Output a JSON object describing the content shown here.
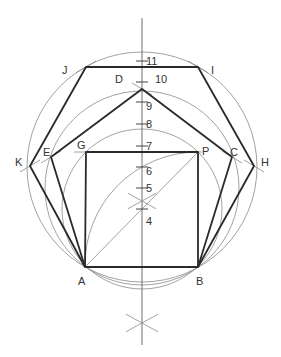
{
  "diagram": {
    "title": "",
    "axis": {
      "x": 142,
      "y1": 18,
      "y2": 345
    },
    "ticks": [
      {
        "label": "4",
        "y": 209,
        "lx": 146,
        "ly": 225
      },
      {
        "label": "5",
        "y": 188,
        "lx": 146,
        "ly": 192
      },
      {
        "label": "6",
        "y": 167,
        "lx": 146,
        "ly": 175
      },
      {
        "label": "7",
        "y": 146,
        "lx": 146,
        "ly": 150
      },
      {
        "label": "8",
        "y": 124,
        "lx": 146,
        "ly": 128
      },
      {
        "label": "9",
        "y": 102,
        "lx": 146,
        "ly": 110
      },
      {
        "label": "10",
        "y": 82,
        "lx": 155,
        "ly": 83
      },
      {
        "label": "11",
        "y": 61,
        "lx": 146,
        "ly": 65
      }
    ],
    "points": {
      "A": {
        "x": 85,
        "y": 267,
        "lx": 78,
        "ly": 285
      },
      "B": {
        "x": 198,
        "y": 267,
        "lx": 196,
        "ly": 285
      },
      "G": {
        "x": 86,
        "y": 152,
        "lx": 77,
        "ly": 149
      },
      "P": {
        "x": 198,
        "y": 152,
        "lx": 202,
        "ly": 155
      },
      "D": {
        "x": 142,
        "y": 89,
        "lx": 115,
        "ly": 83
      },
      "E": {
        "x": 51,
        "y": 157,
        "lx": 43,
        "ly": 156
      },
      "C": {
        "x": 232,
        "y": 157,
        "lx": 230,
        "ly": 156
      },
      "J": {
        "x": 86,
        "y": 67,
        "lx": 62,
        "ly": 74
      },
      "I": {
        "x": 198,
        "y": 67,
        "lx": 211,
        "ly": 74
      },
      "K": {
        "x": 30,
        "y": 166,
        "lx": 15,
        "ly": 166
      },
      "H": {
        "x": 254,
        "y": 166,
        "lx": 261,
        "ly": 166
      }
    },
    "circles": [
      {
        "cx": 142,
        "cy": 209,
        "r": 80
      },
      {
        "cx": 142,
        "cy": 188,
        "r": 97
      },
      {
        "cx": 142,
        "cy": 167,
        "r": 115
      }
    ],
    "arc_from_B": {
      "cx": 198,
      "cy": 267,
      "r": 113
    },
    "lower_cross_y": 323,
    "mid_cross_y": 201,
    "colors": {
      "thick": "#2a2a2a",
      "thin": "#8a8a8a",
      "text": "#333333"
    }
  }
}
